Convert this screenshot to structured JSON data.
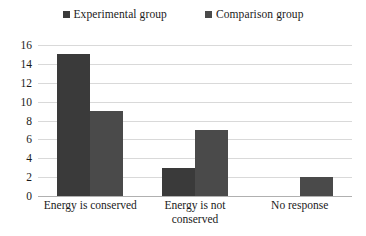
{
  "chart_data": {
    "type": "bar",
    "title": "",
    "subtitle": "",
    "xlabel": "",
    "ylabel": "",
    "categories": [
      "Energy is conserved",
      "Energy is not conserved",
      "No response"
    ],
    "series": [
      {
        "name": "Experimental group",
        "color": "#3a3a3a",
        "values": [
          15,
          3,
          0
        ]
      },
      {
        "name": "Comparison group",
        "color": "#4a4a4a",
        "values": [
          9,
          7,
          2
        ]
      }
    ],
    "ylim": [
      0,
      16
    ],
    "ytick_step": 2,
    "yticks": [
      "0",
      "2",
      "4",
      "6",
      "8",
      "10",
      "12",
      "14",
      "16"
    ],
    "grid": "horizontal",
    "legend_position": "top-center",
    "background_color": "#ffffff",
    "gridline_color": "#d9d9d9",
    "axis_color": "#b0b0b0"
  }
}
